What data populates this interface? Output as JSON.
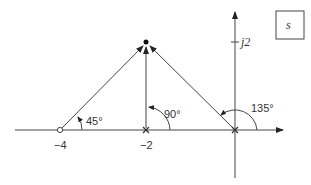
{
  "diagram": {
    "type": "s-plane pole-zero vector diagram",
    "plane_label": "s",
    "imag_tick_label": "j2",
    "real_tick_labels": [
      "−4",
      "−2"
    ],
    "test_point": {
      "re": -2,
      "im": 2,
      "marker": "filled-dot"
    },
    "zeros": [
      {
        "re": -4,
        "im": 0,
        "marker": "open-circle"
      }
    ],
    "poles": [
      {
        "re": -2,
        "im": 0,
        "marker": "x"
      },
      {
        "re": 0,
        "im": 0,
        "marker": "x"
      }
    ],
    "angles": [
      {
        "from": "-4",
        "label": "45°"
      },
      {
        "from": "-2",
        "label": "90°"
      },
      {
        "from": "0",
        "label": "135°"
      }
    ],
    "colors": {
      "line": "#444444",
      "text": "#333333",
      "background": "#ffffff"
    }
  }
}
